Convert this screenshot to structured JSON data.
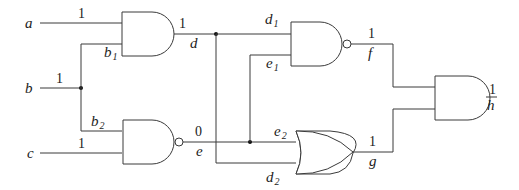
{
  "diagram": {
    "type": "logic-circuit",
    "inputs": [
      {
        "name": "a",
        "value": "1"
      },
      {
        "name": "b",
        "value": "1"
      },
      {
        "name": "c",
        "value": "1"
      }
    ],
    "branches": {
      "b1": {
        "name": "b",
        "sub": "1"
      },
      "b2": {
        "name": "b",
        "sub": "2"
      },
      "d1": {
        "name": "d",
        "sub": "1"
      },
      "d2": {
        "name": "d",
        "sub": "2"
      },
      "e1": {
        "name": "e",
        "sub": "1"
      },
      "e2": {
        "name": "e",
        "sub": "2"
      }
    },
    "gates": [
      {
        "id": "g1",
        "type": "AND",
        "inputs": [
          "a",
          "b1"
        ],
        "output": "d",
        "output_value": "1"
      },
      {
        "id": "g2",
        "type": "NAND",
        "inputs": [
          "b2",
          "c"
        ],
        "output": "e",
        "output_value": "0"
      },
      {
        "id": "g3",
        "type": "NAND",
        "inputs": [
          "d1",
          "e1"
        ],
        "output": "f",
        "output_value": "1"
      },
      {
        "id": "g4",
        "type": "OR",
        "inputs": [
          "e2",
          "d2"
        ],
        "output": "g",
        "output_value": "1"
      },
      {
        "id": "g5",
        "type": "AND",
        "inputs": [
          "f",
          "g"
        ],
        "output": "h",
        "output_value": "1",
        "output_overline": true
      }
    ],
    "labels": {
      "a": "a",
      "b": "b",
      "c": "c",
      "d": "d",
      "e": "e",
      "f": "f",
      "g": "g",
      "h": "h",
      "a_val": "1",
      "b_val": "1",
      "c_val": "1",
      "d_val": "1",
      "e_val": "0",
      "f_val": "1",
      "g_val": "1",
      "h_val": "1"
    }
  }
}
